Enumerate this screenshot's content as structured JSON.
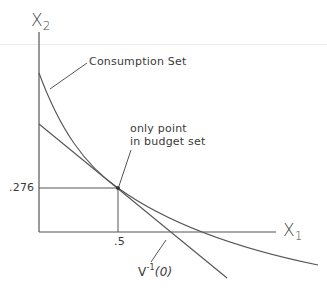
{
  "diagram": {
    "axes": {
      "y_label": "X",
      "y_sub": "2",
      "x_label": "X",
      "x_sub": "1"
    },
    "annotations": {
      "consumption_set": "Consumption Set",
      "only_point_line1": "only point",
      "only_point_line2": "in budget set",
      "level_set_base": "V",
      "level_set_sup": "-1",
      "level_set_arg": "(0)"
    },
    "ticks": {
      "y_value": ".276",
      "x_value": ".5"
    },
    "point": {
      "x": 0.5,
      "y": 0.276
    },
    "colors": {
      "ink": "#555555",
      "background": "#ffffff"
    }
  }
}
